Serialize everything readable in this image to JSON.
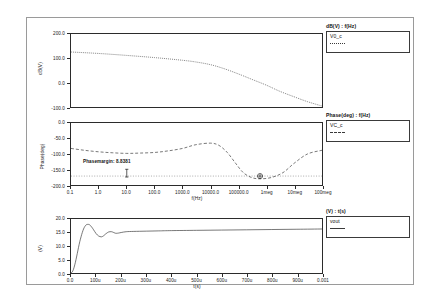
{
  "window": {
    "background": "#ffffff",
    "frame_color": "#9a9a9a"
  },
  "panels": [
    {
      "id": "magnitude",
      "legend_header": "dB(V)  :  f(Hz)",
      "legend_entries": [
        {
          "name": "V0_c",
          "style": "dotted",
          "color": "#3a3a3a"
        }
      ]
    },
    {
      "id": "phase",
      "legend_header": "Phase(deg)  :  f(Hz)",
      "legend_entries": [
        {
          "name": "VC_c",
          "style": "dashed",
          "color": "#3a3a3a"
        }
      ],
      "annotation": "Phasemargin: 8.8381"
    },
    {
      "id": "transient",
      "legend_header": "(V)  :  t(s)",
      "legend_entries": [
        {
          "name": "vout",
          "style": "solid",
          "color": "#3a3a3a"
        }
      ]
    }
  ],
  "chart_data": [
    {
      "type": "line",
      "id": "magnitude",
      "title": "dB(V)  :  f(Hz)",
      "xlabel": "f(Hz)",
      "ylabel": "dB(V)",
      "xscale": "log",
      "xlim": [
        0.1,
        100000000
      ],
      "ylim": [
        -100.0,
        200.0
      ],
      "yticks": [
        200.0,
        100.0,
        0.0,
        -100.0
      ],
      "ytick_labels": [
        "200.0",
        "100.0",
        "0.0",
        "-100.0"
      ],
      "xticks": [
        0.1,
        1,
        10,
        100,
        1000,
        10000,
        100000,
        1000000,
        10000000,
        100000000
      ],
      "xtick_labels": [
        "0.1",
        "1.0",
        "10.0",
        "100.0",
        "1000.0",
        "10000.0",
        "100000.0",
        "1meg",
        "10meg",
        "100meg"
      ],
      "grid": false,
      "legend_position": "outside-right",
      "series": [
        {
          "name": "V0_c",
          "style": "dotted",
          "color": "#3a3a3a",
          "x": [
            0.1,
            1,
            10,
            100,
            1000,
            3000,
            10000,
            30000,
            100000,
            300000,
            1000000,
            3000000,
            10000000,
            30000000,
            100000000
          ],
          "values": [
            126,
            120,
            112,
            103,
            92,
            85,
            74,
            58,
            36,
            14,
            -10,
            -35,
            -58,
            -78,
            -96
          ]
        }
      ]
    },
    {
      "type": "line",
      "id": "phase",
      "title": "Phase(deg)  :  f(Hz)",
      "xlabel": "f(Hz)",
      "ylabel": "Phase(deg)",
      "xscale": "log",
      "xlim": [
        0.1,
        100000000
      ],
      "ylim": [
        -200.0,
        0.0
      ],
      "yticks": [
        0.0,
        -50.0,
        -100.0,
        -150.0,
        -200.0
      ],
      "ytick_labels": [
        "0.0",
        "-50.0",
        "-100.0",
        "-150.0",
        "-200.0"
      ],
      "xticks": [
        0.1,
        1,
        10,
        100,
        1000,
        10000,
        100000,
        1000000,
        10000000,
        100000000
      ],
      "xtick_labels": [
        "0.1",
        "1.0",
        "10.0",
        "100.0",
        "1000.0",
        "10000.0",
        "100000.0",
        "1meg",
        "10meg",
        "100meg"
      ],
      "grid": false,
      "legend_position": "outside-right",
      "annotations": [
        {
          "label": "Phasemargin: 8.8381",
          "value": 8.8381,
          "marker": "crosshair"
        }
      ],
      "reference_line": -171.2,
      "series": [
        {
          "name": "VC_c",
          "style": "dashed",
          "color": "#3a3a3a",
          "x": [
            0.1,
            0.3,
            1,
            3,
            10,
            30,
            100,
            300,
            1000,
            3000,
            10000,
            20000,
            40000,
            80000,
            150000,
            300000,
            600000,
            1500000,
            4000000,
            10000000,
            30000000,
            100000000
          ],
          "values": [
            -82,
            -88,
            -93,
            -96,
            -98,
            -97,
            -95,
            -90,
            -82,
            -70,
            -65,
            -72,
            -95,
            -130,
            -160,
            -176,
            -180,
            -176,
            -160,
            -130,
            -100,
            -88
          ]
        }
      ]
    },
    {
      "type": "line",
      "id": "transient",
      "title": "(V)  :  t(s)",
      "xlabel": "t(s)",
      "ylabel": "(V)",
      "xscale": "linear",
      "xlim": [
        0.0,
        0.001
      ],
      "ylim": [
        0.0,
        20.0
      ],
      "yticks": [
        20.0,
        15.0,
        10.0,
        5.0,
        0.0
      ],
      "ytick_labels": [
        "20.0",
        "15.0",
        "10.0",
        "5.0",
        "0.0"
      ],
      "xticks": [
        0.0,
        0.0001,
        0.0002,
        0.0003,
        0.0004,
        0.0005,
        0.0006,
        0.0007,
        0.0008,
        0.0009,
        0.001
      ],
      "xtick_labels": [
        "0.0",
        "100u",
        "200u",
        "300u",
        "400u",
        "500u",
        "600u",
        "700u",
        "800u",
        "900u",
        "0.001"
      ],
      "grid": false,
      "legend_position": "outside-right",
      "series": [
        {
          "name": "vout",
          "style": "solid",
          "color": "#3a3a3a",
          "x": [
            0.0,
            5e-06,
            1e-05,
            1.5e-05,
            2e-05,
            2.5e-05,
            3e-05,
            3.5e-05,
            4e-05,
            4.5e-05,
            5e-05,
            5.5e-05,
            6e-05,
            6.5e-05,
            7e-05,
            7.5e-05,
            8e-05,
            8.5e-05,
            9e-05,
            0.0001,
            0.00011,
            0.00012,
            0.000125,
            0.00013,
            0.000135,
            0.00014,
            0.00015,
            0.00016,
            0.000165,
            0.00017,
            0.000175,
            0.00018,
            0.00019,
            0.0002,
            0.00022,
            0.00025,
            0.0003,
            0.00035,
            0.0004,
            0.0005,
            0.0006,
            0.0007,
            0.0008,
            0.0009,
            0.001
          ],
          "values": [
            0.0,
            0.4,
            1.4,
            3.0,
            5.0,
            7.2,
            9.5,
            11.6,
            13.4,
            15.0,
            16.3,
            17.2,
            17.8,
            18.0,
            18.0,
            17.8,
            17.3,
            16.7,
            16.0,
            14.6,
            13.7,
            13.4,
            13.5,
            13.8,
            14.2,
            14.6,
            15.2,
            15.3,
            15.2,
            15.0,
            14.8,
            14.7,
            14.8,
            15.0,
            15.3,
            15.4,
            15.5,
            15.6,
            15.7,
            15.8,
            15.9,
            16.0,
            16.1,
            16.2,
            16.3
          ]
        }
      ]
    }
  ]
}
